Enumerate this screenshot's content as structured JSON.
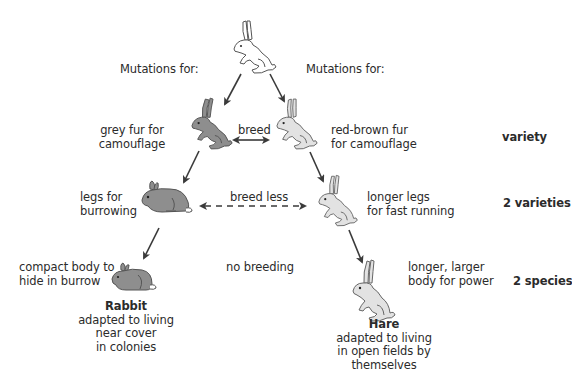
{
  "diagram": {
    "ancestor": {
      "label": "ancestral rabbit",
      "fill": "#ffffff"
    },
    "mutation_headers": {
      "left": "Mutations for:",
      "right": "Mutations for:"
    },
    "left_branch": {
      "step1": {
        "trait_line1": "grey fur for",
        "trait_line2": "camouflage",
        "fill": "#8e8e8e"
      },
      "step2": {
        "trait_line1": "legs for",
        "trait_line2": "burrowing",
        "fill": "#8e8e8e"
      },
      "step3": {
        "trait_line1": "compact body to",
        "trait_line2": "hide in burrow",
        "fill": "#8e8e8e"
      },
      "species": {
        "name": "Rabbit",
        "desc_line1": "adapted to living",
        "desc_line2": "near cover",
        "desc_line3": "in colonies"
      }
    },
    "right_branch": {
      "step1": {
        "trait_line1": "red-brown fur",
        "trait_line2": "for camouflage",
        "fill": "#e2e2e2"
      },
      "step2": {
        "trait_line1": "longer legs",
        "trait_line2": "for fast running",
        "fill": "#e2e2e2"
      },
      "step3": {
        "trait_line1": "longer, larger",
        "trait_line2": "body for power",
        "fill": "#e2e2e2"
      },
      "species": {
        "name": "Hare",
        "desc_line1": "adapted to living",
        "desc_line2": "in open fields by",
        "desc_line3": "themselves"
      }
    },
    "relations": {
      "row1": "breed",
      "row2": "breed less",
      "row3": "no breeding"
    },
    "stages": {
      "row1": "variety",
      "row2": "2 varieties",
      "row3": "2 species"
    },
    "colors": {
      "text": "#2b2b2b",
      "arrow": "#3a3a3a",
      "outline": "#555555",
      "grey_rabbit": "#8e8e8e",
      "light_rabbit": "#e2e2e2"
    }
  }
}
